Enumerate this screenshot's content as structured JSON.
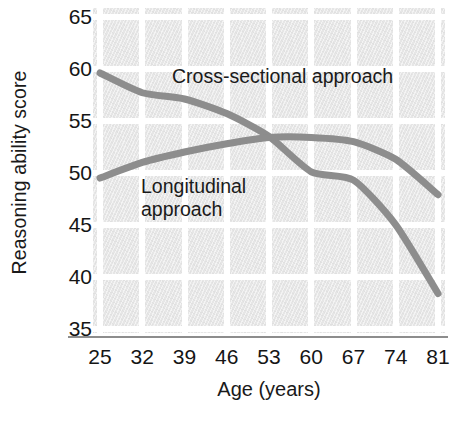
{
  "chart_data": {
    "type": "line",
    "title": "",
    "subtitle": "",
    "xlabel": "Age (years)",
    "ylabel": "Reasoning ability score",
    "x": [
      25,
      32,
      39,
      46,
      53,
      60,
      67,
      74,
      81
    ],
    "xticklabels": [
      "25",
      "32",
      "39",
      "46",
      "53",
      "60",
      "67",
      "74",
      "81"
    ],
    "yticklabels": [
      "65",
      "60",
      "55",
      "50",
      "45",
      "40",
      "35"
    ],
    "yticks": [
      65,
      60,
      55,
      50,
      45,
      40,
      35
    ],
    "xlim": [
      25,
      81
    ],
    "ylim": [
      35,
      65
    ],
    "grid": true,
    "legend_position": "inline-annotations",
    "series": [
      {
        "name": "Cross-sectional approach",
        "color": "#8d8d8d",
        "values": [
          59.6,
          57.7,
          57.1,
          55.7,
          53.5,
          50.1,
          49.3,
          45.0,
          38.4
        ]
      },
      {
        "name": "Longitudinal approach",
        "color": "#8d8d8d",
        "values": [
          49.5,
          51.0,
          52.0,
          52.8,
          53.4,
          53.4,
          53.0,
          51.3,
          47.9
        ]
      }
    ],
    "annotations": [
      {
        "text": "Cross-sectional approach",
        "x": 39,
        "y": 59.8
      },
      {
        "text": "Longitudinal\napproach",
        "x": 35,
        "y": 49.5
      }
    ],
    "colors": {
      "line": "#8d8d8d",
      "plot_background": "#e6e6e6",
      "gridline": "#ffffff",
      "axis": "#8d8d8d",
      "text": "#161616"
    }
  }
}
